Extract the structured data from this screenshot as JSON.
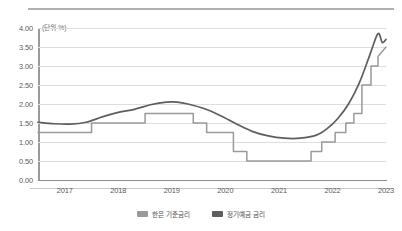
{
  "chart_data": {
    "type": "line",
    "title": "",
    "unit_note": "(단위 %)",
    "xlabel": "",
    "ylabel": "",
    "xlim": [
      2016.5,
      2023.0
    ],
    "ylim": [
      0.0,
      4.0
    ],
    "grid": true,
    "legend_position": "bottom-center",
    "y_ticks": [
      "0.00",
      "0.50",
      "1.00",
      "1.50",
      "2.00",
      "2.50",
      "3.00",
      "3.50",
      "4.00"
    ],
    "y_tick_values": [
      0.0,
      0.5,
      1.0,
      1.5,
      2.0,
      2.5,
      3.0,
      3.5,
      4.0
    ],
    "x_ticks": [
      "2017",
      "2018",
      "2019",
      "2020",
      "2021",
      "2022",
      "2023"
    ],
    "x_tick_values": [
      2017,
      2018,
      2019,
      2020,
      2021,
      2022,
      2023
    ],
    "series": [
      {
        "name": "한은 기준금리",
        "color": "#9a9a9c",
        "style": "step",
        "x": [
          2016.5,
          2017.5,
          2017.5,
          2018.5,
          2018.5,
          2019.4,
          2019.4,
          2019.65,
          2019.65,
          2020.15,
          2020.15,
          2020.4,
          2020.4,
          2021.6,
          2021.6,
          2021.8,
          2021.8,
          2022.05,
          2022.05,
          2022.25,
          2022.25,
          2022.4,
          2022.4,
          2022.55,
          2022.55,
          2022.72,
          2022.72,
          2022.85,
          2022.85,
          2023.0
        ],
        "y": [
          1.25,
          1.25,
          1.5,
          1.5,
          1.75,
          1.75,
          1.5,
          1.5,
          1.25,
          1.25,
          0.75,
          0.75,
          0.5,
          0.5,
          0.75,
          0.75,
          1.0,
          1.0,
          1.25,
          1.25,
          1.5,
          1.5,
          1.75,
          1.75,
          2.5,
          2.5,
          3.0,
          3.0,
          3.25,
          3.5
        ]
      },
      {
        "name": "정기예금 금리",
        "color": "#5e5e60",
        "style": "smooth",
        "x": [
          2016.5,
          2016.8,
          2017.1,
          2017.4,
          2017.7,
          2018.0,
          2018.3,
          2018.6,
          2018.9,
          2019.1,
          2019.3,
          2019.6,
          2019.9,
          2020.2,
          2020.5,
          2020.8,
          2021.1,
          2021.4,
          2021.7,
          2021.9,
          2022.1,
          2022.3,
          2022.5,
          2022.7,
          2022.85,
          2022.93,
          2023.0
        ],
        "y": [
          1.52,
          1.48,
          1.47,
          1.52,
          1.66,
          1.78,
          1.86,
          1.98,
          2.05,
          2.05,
          2.0,
          1.88,
          1.7,
          1.48,
          1.28,
          1.16,
          1.1,
          1.1,
          1.18,
          1.35,
          1.62,
          2.0,
          2.55,
          3.3,
          3.85,
          3.62,
          3.7
        ]
      }
    ],
    "legend": [
      {
        "label": "한은 기준금리",
        "color": "#9a9a9c"
      },
      {
        "label": "정기예금 금리",
        "color": "#5e5e60"
      }
    ]
  }
}
